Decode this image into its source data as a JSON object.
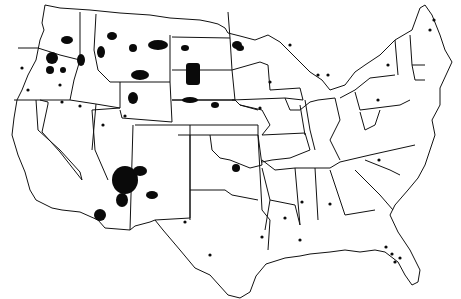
{
  "map": {
    "subject": "Contiguous United States with state boundaries",
    "colors": {
      "background": "#ffffff",
      "boundary": "#111111",
      "marker": "#0a0a0a"
    },
    "legend": null,
    "title": null,
    "marker_regions": [
      {
        "region": "Washington",
        "count": "many"
      },
      {
        "region": "Oregon",
        "count": "several"
      },
      {
        "region": "California",
        "count": "many small"
      },
      {
        "region": "Nevada",
        "count": "many small"
      },
      {
        "region": "Idaho",
        "count": "few"
      },
      {
        "region": "Montana",
        "count": "several large"
      },
      {
        "region": "Wyoming",
        "count": "one large"
      },
      {
        "region": "Utah",
        "count": "few"
      },
      {
        "region": "Arizona",
        "count": "many, very large"
      },
      {
        "region": "New Mexico",
        "count": "several"
      },
      {
        "region": "North Dakota",
        "count": "several"
      },
      {
        "region": "South Dakota",
        "count": "several large"
      },
      {
        "region": "Nebraska",
        "count": "few"
      },
      {
        "region": "Kansas",
        "count": "few"
      },
      {
        "region": "Oklahoma",
        "count": "many"
      },
      {
        "region": "Texas",
        "count": "few"
      },
      {
        "region": "Minnesota",
        "count": "several"
      },
      {
        "region": "Wisconsin",
        "count": "several"
      },
      {
        "region": "Michigan",
        "count": "several"
      },
      {
        "region": "Iowa",
        "count": "one"
      },
      {
        "region": "New York",
        "count": "several"
      },
      {
        "region": "Pennsylvania",
        "count": "one"
      },
      {
        "region": "Maine",
        "count": "several"
      },
      {
        "region": "North Carolina",
        "count": "one"
      },
      {
        "region": "Mississippi",
        "count": "one"
      },
      {
        "region": "Alabama",
        "count": "one"
      },
      {
        "region": "Louisiana",
        "count": "several"
      },
      {
        "region": "Florida",
        "count": "several"
      }
    ]
  }
}
